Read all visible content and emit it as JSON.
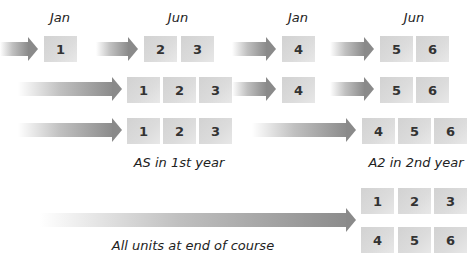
{
  "diagram": {
    "month_labels": [
      {
        "text": "Jan",
        "x": 60,
        "y": 10
      },
      {
        "text": "Jun",
        "x": 178,
        "y": 10
      },
      {
        "text": "Jan",
        "x": 298,
        "y": 10
      },
      {
        "text": "Jun",
        "x": 414,
        "y": 10
      }
    ],
    "rows": [
      {
        "name": "row-1-modular",
        "arrows": [
          {
            "x": 0,
            "y": 37,
            "w": 38
          },
          {
            "x": 96,
            "y": 37,
            "w": 42
          },
          {
            "x": 232,
            "y": 37,
            "w": 44
          },
          {
            "x": 330,
            "y": 37,
            "w": 44
          }
        ],
        "boxes": [
          {
            "label": "1",
            "x": 44,
            "y": 36
          },
          {
            "label": "2",
            "x": 144,
            "y": 36
          },
          {
            "label": "3",
            "x": 181,
            "y": 36
          },
          {
            "label": "4",
            "x": 282,
            "y": 36
          },
          {
            "label": "5",
            "x": 380,
            "y": 36
          },
          {
            "label": "6",
            "x": 416,
            "y": 36
          }
        ]
      },
      {
        "name": "row-2-modular",
        "arrows": [
          {
            "x": 18,
            "y": 77,
            "w": 104
          },
          {
            "x": 232,
            "y": 77,
            "w": 44
          },
          {
            "x": 330,
            "y": 77,
            "w": 44
          }
        ],
        "boxes": [
          {
            "label": "1",
            "x": 127,
            "y": 77
          },
          {
            "label": "2",
            "x": 163,
            "y": 77
          },
          {
            "label": "3",
            "x": 199,
            "y": 77
          },
          {
            "label": "4",
            "x": 282,
            "y": 77
          },
          {
            "label": "5",
            "x": 380,
            "y": 77
          },
          {
            "label": "6",
            "x": 416,
            "y": 77
          }
        ]
      },
      {
        "name": "row-3-as-a2",
        "arrows": [
          {
            "x": 18,
            "y": 118,
            "w": 104
          },
          {
            "x": 252,
            "y": 118,
            "w": 104
          }
        ],
        "boxes": [
          {
            "label": "1",
            "x": 127,
            "y": 118
          },
          {
            "label": "2",
            "x": 163,
            "y": 118
          },
          {
            "label": "3",
            "x": 199,
            "y": 118
          },
          {
            "label": "4",
            "x": 362,
            "y": 118
          },
          {
            "label": "5",
            "x": 398,
            "y": 118
          },
          {
            "label": "6",
            "x": 434,
            "y": 118
          }
        ]
      },
      {
        "name": "row-4-linear",
        "arrows": [
          {
            "x": 40,
            "y": 208,
            "w": 316
          }
        ],
        "boxes": [
          {
            "label": "1",
            "x": 361,
            "y": 188
          },
          {
            "label": "2",
            "x": 398,
            "y": 188
          },
          {
            "label": "3",
            "x": 434,
            "y": 188
          },
          {
            "label": "4",
            "x": 361,
            "y": 227
          },
          {
            "label": "5",
            "x": 398,
            "y": 227
          },
          {
            "label": "6",
            "x": 434,
            "y": 227
          }
        ]
      }
    ],
    "captions": [
      {
        "text": "AS in 1st year",
        "x": 179,
        "y": 155
      },
      {
        "text": "A2 in 2nd year",
        "x": 416,
        "y": 155
      },
      {
        "text": "All units at end of course",
        "x": 193,
        "y": 238
      }
    ],
    "colors": {
      "box": "#d8d8d8",
      "arrow": "#8c8c8c",
      "text": "#333333"
    }
  }
}
